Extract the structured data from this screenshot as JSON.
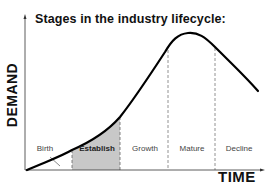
{
  "title": "Stages in the industry lifecycle:",
  "axes": {
    "y_label": "DEMAND",
    "x_label": "TIME"
  },
  "stages": [
    {
      "label": "Birth",
      "highlighted": false
    },
    {
      "label": "Establish",
      "highlighted": true
    },
    {
      "label": "Growth",
      "highlighted": false
    },
    {
      "label": "Mature",
      "highlighted": false
    },
    {
      "label": "Decline",
      "highlighted": false
    }
  ],
  "colors": {
    "curve": "#000000",
    "highlight_fill": "#c8c8c8",
    "divider": "#777777",
    "text": "#111111"
  }
}
